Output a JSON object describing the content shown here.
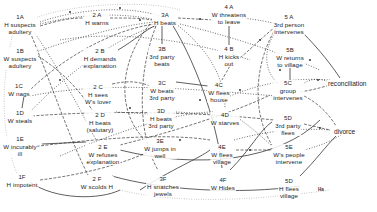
{
  "diagram": {
    "type": "flow-diagram",
    "columns": [
      {
        "stage": 1,
        "nodes": [
          {
            "id": "1A",
            "code": "1A",
            "text": [
              "H suspects",
              "adultery"
            ],
            "x": 20,
            "y": 20
          },
          {
            "id": "1B",
            "code": "1B",
            "text": [
              "W suspects",
              "adultery"
            ],
            "x": 20,
            "y": 52
          },
          {
            "id": "1C",
            "code": "1C",
            "text": [
              "W nags"
            ],
            "x": 19,
            "y": 86
          },
          {
            "id": "1D",
            "code": "1D",
            "text": [
              "W steals"
            ],
            "x": 20,
            "y": 113
          },
          {
            "id": "1E",
            "code": "1E",
            "text": [
              "W incurably",
              "ill"
            ],
            "x": 20,
            "y": 140
          },
          {
            "id": "1F",
            "code": "1F",
            "text": [
              "H impotent"
            ],
            "x": 22,
            "y": 176
          }
        ]
      },
      {
        "stage": 2,
        "nodes": [
          {
            "id": "2A",
            "code": "2 A",
            "text": [
              "H warns"
            ],
            "x": 93,
            "y": 16
          },
          {
            "id": "2B",
            "code": "2 B",
            "text": [
              "H demands",
              "explanation"
            ],
            "x": 100,
            "y": 53
          },
          {
            "id": "2C",
            "code": "2 C",
            "text": [
              "H sees",
              "W's lover"
            ],
            "x": 96,
            "y": 86
          },
          {
            "id": "2D",
            "code": "2 D",
            "text": [
              "H beats",
              "(salutary)"
            ],
            "x": 100,
            "y": 114
          },
          {
            "id": "2E",
            "code": "2 E",
            "text": [
              "W refuses",
              "explanation"
            ],
            "x": 103,
            "y": 145
          },
          {
            "id": "2F",
            "code": "2 F",
            "text": [
              "W scolds H"
            ],
            "x": 95,
            "y": 175
          }
        ]
      },
      {
        "stage": 3,
        "nodes": [
          {
            "id": "3A",
            "code": "3A",
            "text": [
              "H beats"
            ],
            "x": 165,
            "y": 18
          },
          {
            "id": "3B",
            "code": "3B",
            "text": [
              "3rd party",
              "beats"
            ],
            "x": 162,
            "y": 52
          },
          {
            "id": "3C",
            "code": "3C",
            "text": [
              "W beats",
              "3rd party"
            ],
            "x": 162,
            "y": 86
          },
          {
            "id": "3D",
            "code": "3D",
            "text": [
              "H beats",
              "3rd party"
            ],
            "x": 161,
            "y": 114
          },
          {
            "id": "3E",
            "code": "3E",
            "text": [
              "W jumps in",
              "well"
            ],
            "x": 160,
            "y": 143
          },
          {
            "id": "3F",
            "code": "3F",
            "text": [
              "H snatches",
              "jewels"
            ],
            "x": 163,
            "y": 177
          }
        ]
      },
      {
        "stage": 4,
        "nodes": [
          {
            "id": "4A",
            "code": "4 A",
            "text": [
              "W threatens",
              "to leave"
            ],
            "x": 229,
            "y": 10
          },
          {
            "id": "4B",
            "code": "4 B",
            "text": [
              "H  kicks",
              "out"
            ],
            "x": 229,
            "y": 52
          },
          {
            "id": "4C",
            "code": "4C",
            "text": [
              "W flees",
              "house"
            ],
            "x": 219,
            "y": 87
          },
          {
            "id": "4D",
            "code": "4D",
            "text": [
              "W starves"
            ],
            "x": 225,
            "y": 115
          },
          {
            "id": "4E",
            "code": "4E",
            "text": [
              "W flees",
              "village"
            ],
            "x": 222,
            "y": 144
          },
          {
            "id": "4F",
            "code": "4F",
            "text": [
              "W Hides"
            ],
            "x": 223,
            "y": 175
          }
        ]
      },
      {
        "stage": 5,
        "nodes": [
          {
            "id": "5A",
            "code": "5 A",
            "text": [
              "3rd person",
              "intervenes"
            ],
            "x": 289,
            "y": 21
          },
          {
            "id": "5B",
            "code": "5B",
            "text": [
              "W returns",
              "to village"
            ],
            "x": 290,
            "y": 52
          },
          {
            "id": "5C",
            "code": "5C",
            "text": [
              "group",
              "intervenes"
            ],
            "x": 288,
            "y": 89
          },
          {
            "id": "5D",
            "code": "5D",
            "text": [
              "3rd party",
              "flees"
            ],
            "x": 288,
            "y": 118
          },
          {
            "id": "5E",
            "code": "5E",
            "text": [
              "W's people",
              "intervene"
            ],
            "x": 289,
            "y": 147
          },
          {
            "id": "5F",
            "code": "5D",
            "text": [
              "H flees",
              "village"
            ],
            "x": 289,
            "y": 178
          }
        ]
      }
    ],
    "outcomes": [
      {
        "id": "reconciliation",
        "label": "reconciliation",
        "x": 330,
        "y": 82
      },
      {
        "id": "divorce",
        "label": "divorce",
        "x": 332,
        "y": 130
      }
    ],
    "signature": {
      "label": "Ha",
      "x": 318,
      "y": 187
    },
    "legend_abbreviations": {
      "H": "husband",
      "W": "wife"
    }
  }
}
